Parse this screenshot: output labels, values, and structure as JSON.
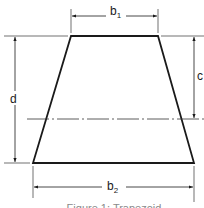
{
  "figure": {
    "caption": "Figure 1: Trapezoid",
    "shape": "trapezoid",
    "colors": {
      "stroke": "#1a1a1a",
      "caption": "#8a8a8a",
      "background": "#ffffff"
    }
  },
  "dimensions": {
    "b1": {
      "base": "b",
      "sub": "1",
      "description": "top width"
    },
    "b2": {
      "base": "b",
      "sub": "2",
      "description": "bottom width"
    },
    "d": {
      "label": "d",
      "description": "height"
    },
    "c": {
      "label": "c",
      "description": "distance from top to centroid axis"
    }
  },
  "centroid_axis": {
    "style": "dash-dot"
  }
}
